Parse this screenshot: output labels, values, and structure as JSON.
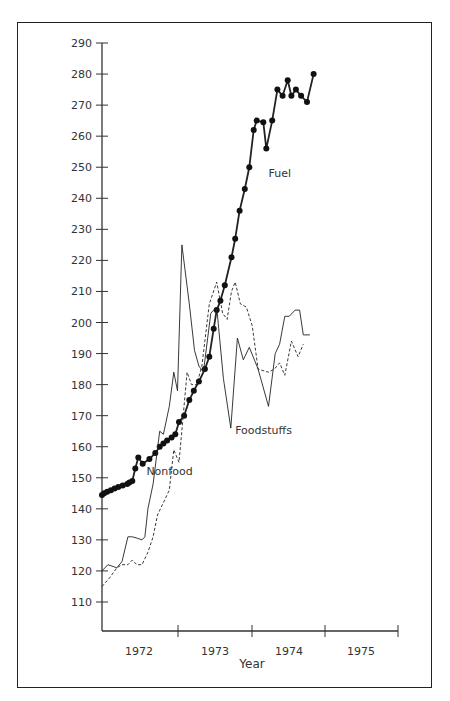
{
  "chart_data": {
    "type": "line",
    "title": "",
    "xlabel": "Year",
    "ylabel": "",
    "ylim": [
      100,
      290
    ],
    "yticks": [
      110,
      120,
      130,
      140,
      150,
      160,
      170,
      180,
      190,
      200,
      210,
      220,
      230,
      240,
      250,
      260,
      270,
      280,
      290
    ],
    "xticks": [
      "1972",
      "1973",
      "1974",
      "1975"
    ],
    "xlim": [
      1971.75,
      1975.75
    ],
    "grid": false,
    "legend": "inline labels",
    "series": [
      {
        "name": "Fuel",
        "style": "solid thick with dot markers",
        "points": [
          [
            1971.75,
            144.5
          ],
          [
            1971.78,
            145
          ],
          [
            1971.82,
            145.5
          ],
          [
            1971.87,
            146
          ],
          [
            1971.92,
            146.5
          ],
          [
            1971.97,
            147
          ],
          [
            1972.03,
            147.5
          ],
          [
            1972.09,
            148
          ],
          [
            1972.12,
            148.5
          ],
          [
            1972.16,
            149
          ],
          [
            1972.2,
            153
          ],
          [
            1972.24,
            156.5
          ],
          [
            1972.3,
            154.5
          ],
          [
            1972.39,
            156
          ],
          [
            1972.47,
            158
          ],
          [
            1972.53,
            160
          ],
          [
            1972.58,
            161
          ],
          [
            1972.63,
            162
          ],
          [
            1972.69,
            163
          ],
          [
            1972.74,
            164
          ],
          [
            1972.79,
            168
          ],
          [
            1972.86,
            170
          ],
          [
            1972.93,
            175
          ],
          [
            1972.99,
            178
          ],
          [
            1973.06,
            181
          ],
          [
            1973.14,
            185
          ],
          [
            1973.2,
            189
          ],
          [
            1973.26,
            198
          ],
          [
            1973.3,
            204
          ],
          [
            1973.35,
            207
          ],
          [
            1973.41,
            212
          ],
          [
            1973.5,
            221
          ],
          [
            1973.55,
            227
          ],
          [
            1973.61,
            236
          ],
          [
            1973.68,
            243
          ],
          [
            1973.74,
            250
          ],
          [
            1973.8,
            262
          ],
          [
            1973.84,
            265
          ],
          [
            1973.93,
            264.5
          ],
          [
            1973.97,
            256
          ],
          [
            1974.05,
            265
          ],
          [
            1974.12,
            275
          ],
          [
            1974.19,
            273
          ],
          [
            1974.26,
            278
          ],
          [
            1974.31,
            273
          ],
          [
            1974.37,
            275
          ],
          [
            1974.44,
            273
          ],
          [
            1974.52,
            271
          ],
          [
            1974.61,
            280
          ]
        ]
      },
      {
        "name": "Foodstuffs",
        "style": "solid thin",
        "points": [
          [
            1971.75,
            120
          ],
          [
            1971.83,
            122
          ],
          [
            1971.95,
            121
          ],
          [
            1972.02,
            123
          ],
          [
            1972.1,
            131
          ],
          [
            1972.16,
            131
          ],
          [
            1972.23,
            130.5
          ],
          [
            1972.29,
            130
          ],
          [
            1972.33,
            131
          ],
          [
            1972.37,
            140
          ],
          [
            1972.44,
            148
          ],
          [
            1972.53,
            165
          ],
          [
            1972.58,
            164
          ],
          [
            1972.66,
            173
          ],
          [
            1972.72,
            184
          ],
          [
            1972.77,
            178
          ],
          [
            1972.83,
            225
          ],
          [
            1972.93,
            206
          ],
          [
            1973.0,
            191
          ],
          [
            1973.06,
            186
          ],
          [
            1973.12,
            184
          ],
          [
            1973.22,
            203
          ],
          [
            1973.3,
            205
          ],
          [
            1973.39,
            182
          ],
          [
            1973.49,
            166
          ],
          [
            1973.58,
            195
          ],
          [
            1973.66,
            188
          ],
          [
            1973.74,
            192
          ],
          [
            1973.86,
            185
          ],
          [
            1974.0,
            173
          ],
          [
            1974.09,
            190
          ],
          [
            1974.15,
            193
          ],
          [
            1974.22,
            202
          ],
          [
            1974.28,
            202
          ],
          [
            1974.36,
            204
          ],
          [
            1974.42,
            204
          ],
          [
            1974.47,
            196
          ],
          [
            1974.56,
            196
          ]
        ]
      },
      {
        "name": "Nonfood",
        "style": "dashed thin",
        "points": [
          [
            1971.75,
            115
          ],
          [
            1971.86,
            118
          ],
          [
            1971.95,
            121
          ],
          [
            1972.02,
            122
          ],
          [
            1972.1,
            122
          ],
          [
            1972.16,
            123.5
          ],
          [
            1972.22,
            122
          ],
          [
            1972.29,
            122
          ],
          [
            1972.37,
            126
          ],
          [
            1972.44,
            131
          ],
          [
            1972.5,
            138
          ],
          [
            1972.58,
            142
          ],
          [
            1972.66,
            146
          ],
          [
            1972.72,
            159
          ],
          [
            1972.79,
            155
          ],
          [
            1972.9,
            184
          ],
          [
            1972.96,
            180
          ],
          [
            1973.03,
            180
          ],
          [
            1973.1,
            186
          ],
          [
            1973.2,
            206
          ],
          [
            1973.3,
            213
          ],
          [
            1973.38,
            203
          ],
          [
            1973.44,
            201
          ],
          [
            1973.5,
            210
          ],
          [
            1973.55,
            213
          ],
          [
            1973.62,
            206
          ],
          [
            1973.7,
            205
          ],
          [
            1973.78,
            199
          ],
          [
            1973.86,
            185
          ],
          [
            1974.0,
            184
          ],
          [
            1974.08,
            185
          ],
          [
            1974.15,
            187
          ],
          [
            1974.22,
            183
          ],
          [
            1974.31,
            194
          ],
          [
            1974.4,
            189
          ],
          [
            1974.47,
            193
          ]
        ]
      }
    ],
    "annotations": [
      {
        "text": "Fuel",
        "x": 1974.0,
        "y": 247
      },
      {
        "text": "Foodstuffs",
        "x": 1973.55,
        "y": 164
      },
      {
        "text": "Nonfood",
        "x": 1972.35,
        "y": 151
      }
    ]
  },
  "labels": {
    "xaxis_title": "Year",
    "fuel": "Fuel",
    "foodstuffs": "Foodstuffs",
    "nonfood": "Nonfood"
  }
}
